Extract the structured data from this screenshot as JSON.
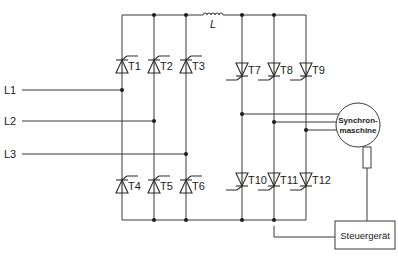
{
  "diagram": {
    "title": "",
    "colors": {
      "line": "#3a3a3a",
      "text": "#222222",
      "background": "#ffffff"
    },
    "inductor": {
      "label": "L",
      "x1": 203,
      "x2": 223,
      "y": 15
    },
    "rails": {
      "top_y": 15,
      "bottom_y": 220,
      "left_x": 122,
      "right_x": 306
    },
    "left_columns": [
      122,
      154,
      186
    ],
    "right_columns": [
      242,
      274,
      306
    ],
    "inputs": [
      {
        "label": "L1",
        "y": 90,
        "node_x": 122
      },
      {
        "label": "L2",
        "y": 121,
        "node_x": 154
      },
      {
        "label": "L3",
        "y": 154,
        "node_x": 186
      }
    ],
    "thyristors_upper_left": [
      {
        "label": "T1",
        "x": 122,
        "y": 66
      },
      {
        "label": "T2",
        "x": 154,
        "y": 66
      },
      {
        "label": "T3",
        "x": 186,
        "y": 66
      }
    ],
    "thyristors_lower_left": [
      {
        "label": "T4",
        "x": 122,
        "y": 186
      },
      {
        "label": "T5",
        "x": 154,
        "y": 186
      },
      {
        "label": "T6",
        "x": 186,
        "y": 186
      }
    ],
    "thyristors_upper_right": [
      {
        "label": "T7",
        "x": 242,
        "y": 70
      },
      {
        "label": "T8",
        "x": 274,
        "y": 70
      },
      {
        "label": "T9",
        "x": 306,
        "y": 70
      }
    ],
    "thyristors_lower_right": [
      {
        "label": "T10",
        "x": 242,
        "y": 180
      },
      {
        "label": "T11",
        "x": 274,
        "y": 180
      },
      {
        "label": "T12",
        "x": 306,
        "y": 180
      }
    ],
    "motor": {
      "label_line1": "Synchron-",
      "label_line2": "maschine",
      "cx": 358,
      "cy": 125,
      "r": 22,
      "phase_y": [
        114,
        122,
        130
      ]
    },
    "sensor": {
      "x": 363,
      "y": 147,
      "w": 8,
      "h": 21
    },
    "controller": {
      "label": "Steuergerät",
      "x": 335,
      "y": 221,
      "w": 60,
      "h": 28
    },
    "control_line": {
      "from_x": 274,
      "from_y": 226,
      "mid_y": 237
    }
  }
}
